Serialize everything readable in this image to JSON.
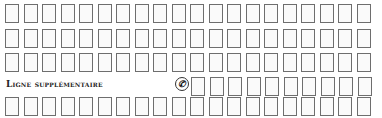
{
  "form": {
    "rows": [
      {
        "boxes": 20,
        "top": 4
      },
      {
        "boxes": 20,
        "top": 29
      },
      {
        "boxes": 20,
        "top": 53
      },
      {
        "boxes": 10,
        "top": 77,
        "left": 191
      },
      {
        "boxes": 20,
        "top": 97
      }
    ],
    "extra_line_label": "Ligne supplémentaire",
    "phone_icon": "phone-icon",
    "phone_glyph": "✆"
  }
}
